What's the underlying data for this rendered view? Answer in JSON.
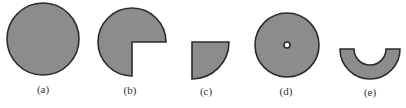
{
  "figure": {
    "style": {
      "fill_color": "#8c8c8c",
      "stroke_color": "#2b2b2b",
      "background": "#ffffff",
      "label_color": "#333333"
    },
    "panels": [
      {
        "id": "a",
        "label": "(a)",
        "shape": "full circle",
        "center": [
          43,
          39
        ],
        "outer_radius": 36
      },
      {
        "id": "b",
        "label": "(b)",
        "shape": "three-quarter circle (bottom-right quadrant removed)",
        "center": [
          132,
          42
        ],
        "outer_radius": 34
      },
      {
        "id": "c",
        "label": "(c)",
        "shape": "quarter circle (corner at top-left)",
        "center": [
          192,
          42
        ],
        "outer_radius": 37
      },
      {
        "id": "d",
        "label": "(d)",
        "shape": "annulus with small central hole",
        "center": [
          287,
          45
        ],
        "outer_radius": 32,
        "inner_radius": 3
      },
      {
        "id": "e",
        "label": "(e)",
        "shape": "half annulus (lower half)",
        "center": [
          370,
          49
        ],
        "outer_radius": 30,
        "inner_radius": 16
      }
    ]
  }
}
